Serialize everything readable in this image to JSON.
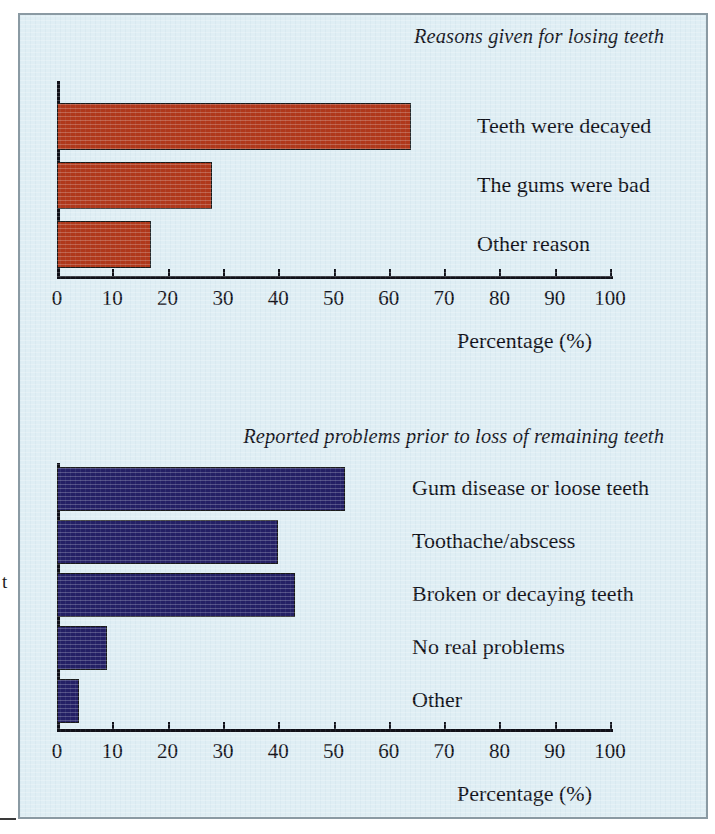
{
  "figure": {
    "background_color": "#dfeef4",
    "border_color": "#8a9aa3",
    "bleed_glyph": "t"
  },
  "chart_data": [
    {
      "type": "bar",
      "orientation": "horizontal",
      "title": "Reasons given for losing teeth",
      "xlabel": "Percentage (%)",
      "ylabel": "",
      "xlim": [
        0,
        100
      ],
      "grid": false,
      "legend": "none",
      "bar_color": "#b0381b",
      "tick_labels": [
        "0",
        "10",
        "20",
        "30",
        "40",
        "50",
        "60",
        "70",
        "80",
        "90",
        "100"
      ],
      "ticks": [
        0,
        10,
        20,
        30,
        40,
        50,
        60,
        70,
        80,
        90,
        100
      ],
      "categories": [
        "Teeth were decayed",
        "The gums were bad",
        "Other reason"
      ],
      "values": [
        64,
        28,
        17
      ]
    },
    {
      "type": "bar",
      "orientation": "horizontal",
      "title": "Reported problems prior to loss of remaining teeth",
      "xlabel": "Percentage (%)",
      "ylabel": "",
      "xlim": [
        0,
        100
      ],
      "grid": false,
      "legend": "none",
      "bar_color": "#242065",
      "tick_labels": [
        "0",
        "10",
        "20",
        "30",
        "40",
        "50",
        "60",
        "70",
        "80",
        "90",
        "100"
      ],
      "ticks": [
        0,
        10,
        20,
        30,
        40,
        50,
        60,
        70,
        80,
        90,
        100
      ],
      "categories": [
        "Gum disease or loose teeth",
        "Toothache/abscess",
        "Broken or decaying teeth",
        "No real problems",
        "Other"
      ],
      "values": [
        52,
        40,
        43,
        9,
        4
      ]
    }
  ]
}
